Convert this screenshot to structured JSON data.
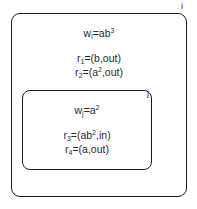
{
  "diagram": {
    "type": "nested-region-diagram",
    "background_color": "#ffffff",
    "stroke_color": "#1c1c1c",
    "text_color": "#2a2a2a",
    "outer_region": {
      "label": "i",
      "weight": {
        "symbol": "w",
        "subscript": "i",
        "equals": "=",
        "base": "ab",
        "exponent": "3",
        "full_text": "w_i=ab^3"
      },
      "rules": [
        {
          "symbol": "r",
          "subscript": "1",
          "equals": "=",
          "open": "(",
          "term": "b",
          "term_exponent": "",
          "comma": ",",
          "direction": "out",
          "close": ")",
          "full_text": "r_1=(b,out)"
        },
        {
          "symbol": "r",
          "subscript": "2",
          "equals": "=",
          "open": "(",
          "term": "a",
          "term_exponent": "2",
          "comma": ",",
          "direction": "out",
          "close": ")",
          "full_text": "r_2=(a^2,out)"
        }
      ]
    },
    "inner_region": {
      "label": "j",
      "weight": {
        "symbol": "w",
        "subscript": "j",
        "equals": "=",
        "base": "a",
        "exponent": "2",
        "full_text": "w_j=a^2"
      },
      "rules": [
        {
          "symbol": "r",
          "subscript": "3",
          "equals": "=",
          "open": "(",
          "term": "ab",
          "term_exponent": "2",
          "comma": ",",
          "direction": "in",
          "close": ")",
          "full_text": "r_3=(ab^2,in)"
        },
        {
          "symbol": "r",
          "subscript": "4",
          "equals": "=",
          "open": "(",
          "term": "a",
          "term_exponent": "",
          "comma": ",",
          "direction": "out",
          "close": ")",
          "full_text": "r_4=(a,out)"
        }
      ]
    }
  }
}
